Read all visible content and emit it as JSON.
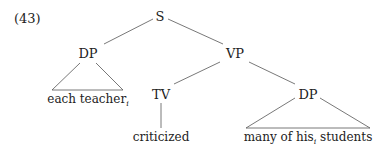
{
  "example_number": "(43)",
  "nodes": {
    "s": "S",
    "dp_subject": "DP",
    "vp": "VP",
    "tv": "TV",
    "dp_object": "DP"
  },
  "leaves": {
    "subject_text": "each teacher",
    "subject_index": "i",
    "verb": "criticized",
    "object_pre": "many of his",
    "object_index": "i",
    "object_post": " students"
  }
}
